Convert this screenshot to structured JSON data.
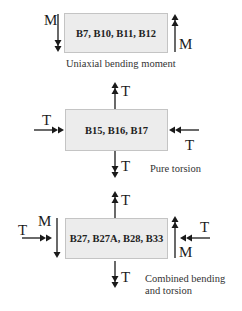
{
  "diagram": {
    "panels": [
      {
        "id": "uniaxial",
        "box_label": "B7, B10, B11, B12",
        "caption": "Uniaxial bending moment",
        "loads": {
          "left_moment": "M",
          "right_moment": "M"
        }
      },
      {
        "id": "pure-torsion",
        "box_label": "B15, B16, B17",
        "caption": "Pure torsion",
        "loads": {
          "top_torsion": "T",
          "bottom_torsion": "T",
          "left_torsion": "T",
          "right_torsion": "T"
        }
      },
      {
        "id": "combined",
        "box_label": "B27, B27A, B28, B33",
        "caption_line1": "Combined bending",
        "caption_line2": "and torsion",
        "loads": {
          "top_torsion": "T",
          "bottom_torsion": "T",
          "left_torsion": "T",
          "right_torsion": "T",
          "left_moment": "M",
          "right_moment": "M"
        }
      }
    ],
    "colors": {
      "box_fill": "#ececec",
      "box_border": "#c4c4c4",
      "arrow": "#1a1a1a"
    }
  }
}
